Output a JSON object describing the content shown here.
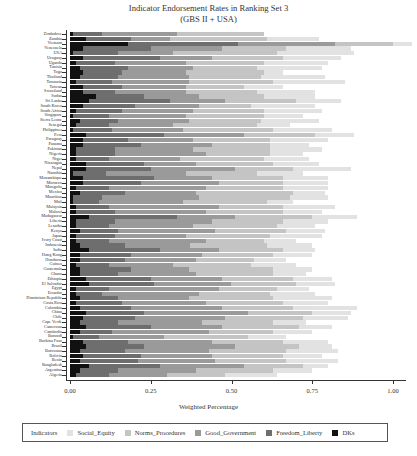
{
  "chart_data": {
    "type": "bar",
    "orientation": "horizontal",
    "stacked": true,
    "title": "Indicator Endorsement Rates in Ranking Set 3",
    "subtitle": "(GBS II + USA)",
    "xlabel": "Weighted Percentage",
    "ylabel": "",
    "xlim": [
      0,
      1
    ],
    "x_ticks": [
      "0.00",
      "0.25",
      "0.50",
      "0.75",
      "1.00"
    ],
    "grid": false,
    "legend_position": "bottom",
    "legend_title": "Indicators",
    "categories": [
      "Zimbabwe",
      "Zambia",
      "Vietnam",
      "Venezuela",
      "USA",
      "Uruguay",
      "Uganda",
      "Tunisia",
      "Togo",
      "Thailand",
      "Tanzania",
      "Taiwan",
      "Swaziland",
      "Sudan",
      "Sri Lanka",
      "South Korea",
      "South Africa",
      "Singapore",
      "Sierra Leone",
      "Senegal",
      "Philippines",
      "Peru",
      "Paraguay",
      "Panama",
      "Pakistan",
      "Nigeria",
      "Niger",
      "Nicaragua",
      "Nepal",
      "Namibia",
      "Mozambique",
      "Morocco",
      "Mongolia",
      "Mexico",
      "Mauritius",
      "Mali",
      "Malaysia",
      "Malawi",
      "Madagascar",
      "Liberia",
      "Lesotho",
      "Kenya",
      "Japan",
      "Ivory Coast",
      "Indonesia",
      "India",
      "Hong Kong",
      "Honduras",
      "Guinea",
      "Guatemala",
      "Ghana",
      "Ethiopia",
      "El Salvador",
      "Egypt",
      "Ecuador",
      "Dominican Republic",
      "Costa Rica",
      "Colombia",
      "China",
      "Chile",
      "Cape Verde",
      "Cameroon",
      "Cambodia",
      "Burundi",
      "Burkina Faso",
      "Brazil",
      "Botswana",
      "Bolivia",
      "Benin",
      "Bangladesh",
      "Argentina",
      "Algeria"
    ],
    "series": [
      {
        "name": "DKs",
        "color": "#111111",
        "values": [
          0.01,
          0.05,
          0.18,
          0.04,
          0.01,
          0.04,
          0.02,
          0.03,
          0.04,
          0.03,
          0.02,
          0.04,
          0.04,
          0.08,
          0.06,
          0.04,
          0.02,
          0.01,
          0.03,
          0.02,
          0.01,
          0.05,
          0.04,
          0.04,
          0.02,
          0.02,
          0.02,
          0.05,
          0.05,
          0.01,
          0.04,
          0.04,
          0.02,
          0.03,
          0.01,
          0.01,
          0.02,
          0.02,
          0.06,
          0.02,
          0.02,
          0.03,
          0.02,
          0.02,
          0.03,
          0.06,
          0.03,
          0.03,
          0.02,
          0.03,
          0.03,
          0.05,
          0.06,
          0.02,
          0.02,
          0.03,
          0.02,
          0.03,
          0.05,
          0.04,
          0.03,
          0.05,
          0.03,
          0.01,
          0.04,
          0.05,
          0.03,
          0.04,
          0.03,
          0.06,
          0.03,
          0.02
        ]
      },
      {
        "name": "Freedom_Liberty",
        "color": "#6e6e6e",
        "values": [
          0.09,
          0.14,
          0.34,
          0.21,
          0.14,
          0.24,
          0.12,
          0.15,
          0.12,
          0.12,
          0.11,
          0.12,
          0.1,
          0.15,
          0.25,
          0.16,
          0.14,
          0.11,
          0.12,
          0.1,
          0.12,
          0.24,
          0.14,
          0.18,
          0.12,
          0.12,
          0.1,
          0.18,
          0.2,
          0.1,
          0.22,
          0.18,
          0.1,
          0.14,
          0.09,
          0.08,
          0.1,
          0.12,
          0.27,
          0.12,
          0.1,
          0.12,
          0.12,
          0.1,
          0.14,
          0.22,
          0.16,
          0.14,
          0.1,
          0.16,
          0.12,
          0.2,
          0.2,
          0.1,
          0.08,
          0.12,
          0.14,
          0.16,
          0.18,
          0.16,
          0.12,
          0.2,
          0.1,
          0.08,
          0.14,
          0.18,
          0.14,
          0.18,
          0.18,
          0.22,
          0.12,
          0.1
        ]
      },
      {
        "name": "Good_Government",
        "color": "#9a9a9a",
        "values": [
          0.23,
          0.12,
          0.3,
          0.22,
          0.17,
          0.16,
          0.22,
          0.2,
          0.2,
          0.22,
          0.24,
          0.2,
          0.22,
          0.17,
          0.17,
          0.2,
          0.22,
          0.24,
          0.22,
          0.2,
          0.22,
          0.25,
          0.2,
          0.22,
          0.24,
          0.28,
          0.22,
          0.16,
          0.26,
          0.25,
          0.18,
          0.24,
          0.3,
          0.22,
          0.3,
          0.26,
          0.34,
          0.28,
          0.18,
          0.3,
          0.26,
          0.3,
          0.22,
          0.3,
          0.2,
          0.18,
          0.22,
          0.22,
          0.2,
          0.18,
          0.24,
          0.22,
          0.24,
          0.34,
          0.3,
          0.22,
          0.26,
          0.28,
          0.32,
          0.28,
          0.26,
          0.22,
          0.3,
          0.2,
          0.26,
          0.28,
          0.26,
          0.22,
          0.24,
          0.26,
          0.24,
          0.18
        ]
      },
      {
        "name": "Norms_Procedures",
        "color": "#c4c4c4",
        "values": [
          0.27,
          0.3,
          0.18,
          0.2,
          0.32,
          0.22,
          0.24,
          0.2,
          0.24,
          0.22,
          0.26,
          0.18,
          0.22,
          0.2,
          0.22,
          0.16,
          0.22,
          0.24,
          0.22,
          0.26,
          0.28,
          0.22,
          0.24,
          0.18,
          0.24,
          0.2,
          0.26,
          0.24,
          0.18,
          0.22,
          0.22,
          0.2,
          0.24,
          0.3,
          0.28,
          0.26,
          0.2,
          0.24,
          0.24,
          0.22,
          0.26,
          0.22,
          0.26,
          0.18,
          0.24,
          0.2,
          0.22,
          0.18,
          0.24,
          0.26,
          0.24,
          0.22,
          0.2,
          0.18,
          0.22,
          0.26,
          0.24,
          0.22,
          0.2,
          0.24,
          0.22,
          0.24,
          0.2,
          0.26,
          0.22,
          0.2,
          0.24,
          0.22,
          0.22,
          0.18,
          0.24,
          0.18
        ]
      },
      {
        "name": "Social_Equity",
        "color": "#e2e2e2",
        "values": [
          0.0,
          0.16,
          0.06,
          0.2,
          0.24,
          0.18,
          0.2,
          0.2,
          0.06,
          0.2,
          0.22,
          0.12,
          0.18,
          0.16,
          0.14,
          0.2,
          0.18,
          0.12,
          0.18,
          0.1,
          0.18,
          0.12,
          0.18,
          0.12,
          0.16,
          0.1,
          0.14,
          0.14,
          0.18,
          0.14,
          0.14,
          0.14,
          0.14,
          0.1,
          0.12,
          0.08,
          0.16,
          0.12,
          0.14,
          0.14,
          0.12,
          0.12,
          0.16,
          0.1,
          0.14,
          0.1,
          0.12,
          0.1,
          0.14,
          0.12,
          0.1,
          0.12,
          0.12,
          0.1,
          0.14,
          0.18,
          0.14,
          0.2,
          0.12,
          0.14,
          0.1,
          0.1,
          0.12,
          0.12,
          0.14,
          0.1,
          0.16,
          0.12,
          0.16,
          0.08,
          0.12,
          0.16
        ]
      }
    ]
  }
}
